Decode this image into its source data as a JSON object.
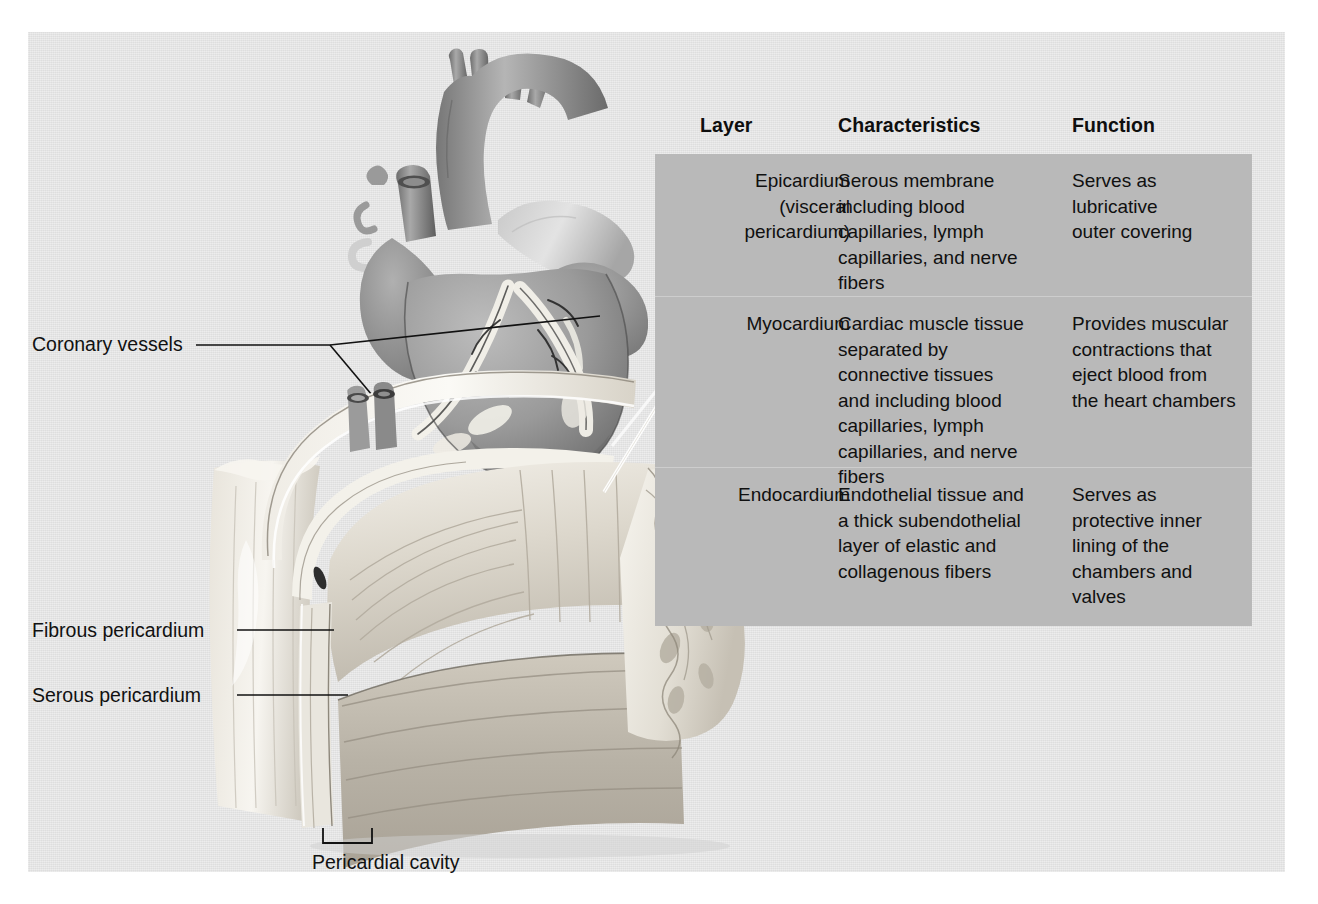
{
  "figure": {
    "panel_color": "#e4e4e4",
    "table_color": "#b9b9b9"
  },
  "table": {
    "headers": {
      "layer": "Layer",
      "characteristics": "Characteristics",
      "function": "Function"
    },
    "rows": [
      {
        "layer": "Epicardium\n(visceral\npericardium)",
        "characteristics": "Serous membrane\nincluding blood\ncapillaries, lymph\ncapillaries, and nerve\nfibers",
        "function": "Serves as\nlubricative\nouter covering"
      },
      {
        "layer": "Myocardium",
        "characteristics": "Cardiac muscle tissue\nseparated by\nconnective tissues\nand including blood\ncapillaries, lymph\ncapillaries, and nerve\nfibers",
        "function": "Provides muscular\ncontractions that\neject blood from\nthe heart chambers"
      },
      {
        "layer": "Endocardium",
        "characteristics": "Endothelial tissue and\na thick subendothelial\nlayer of elastic and\ncollagenous fibers",
        "function": "Serves as\nprotective inner\nlining of the\nchambers and\nvalves"
      }
    ]
  },
  "annotations": {
    "coronary_vessels": "Coronary vessels",
    "fibrous_pericardium": "Fibrous pericardium",
    "serous_pericardium": "Serous pericardium",
    "pericardial_cavity": "Pericardial cavity"
  },
  "illustrations": {
    "heart": "anterior-heart-with-coronary-vessels",
    "wedge": "heart-wall-cutaway-wedge"
  }
}
